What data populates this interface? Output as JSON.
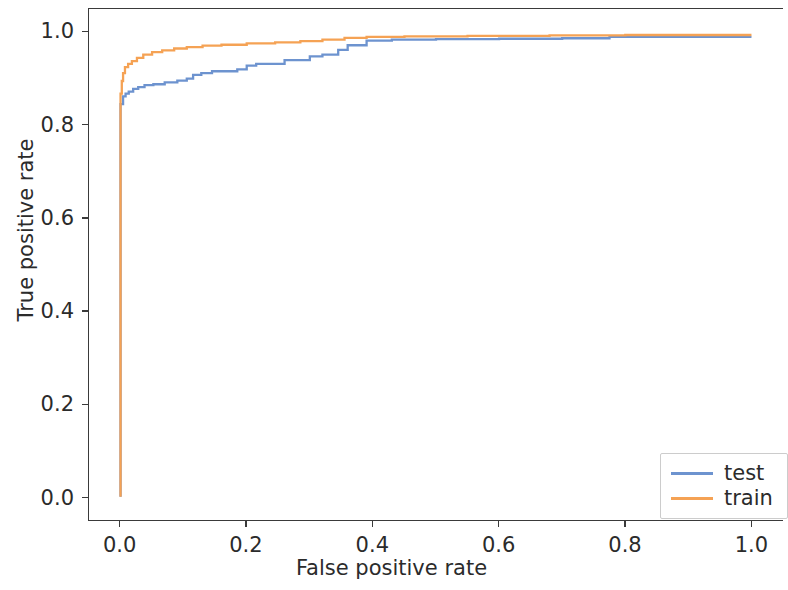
{
  "chart_data": {
    "type": "line",
    "title": "",
    "xlabel": "False positive rate",
    "ylabel": "True positive rate",
    "xlim": [
      -0.05,
      1.05
    ],
    "ylim": [
      -0.05,
      1.05
    ],
    "xticks": [
      0.0,
      0.2,
      0.4,
      0.6,
      0.8,
      1.0
    ],
    "xtick_labels": [
      "0.0",
      "0.2",
      "0.4",
      "0.6",
      "0.8",
      "1.0"
    ],
    "yticks": [
      0.0,
      0.2,
      0.4,
      0.6,
      0.8,
      1.0
    ],
    "ytick_labels": [
      "0.0",
      "0.2",
      "0.4",
      "0.6",
      "0.8",
      "1.0"
    ],
    "grid": false,
    "legend_position": "lower right",
    "series": [
      {
        "name": "test",
        "color": "#6d93cf",
        "points": [
          [
            0.0,
            0.0
          ],
          [
            0.0,
            0.845
          ],
          [
            0.004,
            0.845
          ],
          [
            0.004,
            0.862
          ],
          [
            0.008,
            0.862
          ],
          [
            0.008,
            0.868
          ],
          [
            0.013,
            0.868
          ],
          [
            0.013,
            0.872
          ],
          [
            0.02,
            0.872
          ],
          [
            0.02,
            0.878
          ],
          [
            0.028,
            0.878
          ],
          [
            0.028,
            0.882
          ],
          [
            0.038,
            0.882
          ],
          [
            0.038,
            0.886
          ],
          [
            0.052,
            0.886
          ],
          [
            0.052,
            0.888
          ],
          [
            0.07,
            0.888
          ],
          [
            0.07,
            0.892
          ],
          [
            0.09,
            0.892
          ],
          [
            0.09,
            0.896
          ],
          [
            0.105,
            0.896
          ],
          [
            0.105,
            0.9
          ],
          [
            0.115,
            0.9
          ],
          [
            0.115,
            0.908
          ],
          [
            0.128,
            0.908
          ],
          [
            0.128,
            0.912
          ],
          [
            0.145,
            0.912
          ],
          [
            0.145,
            0.916
          ],
          [
            0.185,
            0.916
          ],
          [
            0.185,
            0.92
          ],
          [
            0.2,
            0.92
          ],
          [
            0.2,
            0.928
          ],
          [
            0.215,
            0.928
          ],
          [
            0.215,
            0.932
          ],
          [
            0.26,
            0.932
          ],
          [
            0.26,
            0.94
          ],
          [
            0.3,
            0.94
          ],
          [
            0.3,
            0.948
          ],
          [
            0.32,
            0.948
          ],
          [
            0.32,
            0.952
          ],
          [
            0.345,
            0.952
          ],
          [
            0.345,
            0.962
          ],
          [
            0.36,
            0.962
          ],
          [
            0.36,
            0.972
          ],
          [
            0.39,
            0.972
          ],
          [
            0.39,
            0.982
          ],
          [
            0.43,
            0.982
          ],
          [
            0.43,
            0.984
          ],
          [
            0.5,
            0.984
          ],
          [
            0.5,
            0.985
          ],
          [
            0.6,
            0.985
          ],
          [
            0.6,
            0.986
          ],
          [
            0.7,
            0.986
          ],
          [
            0.7,
            0.987
          ],
          [
            0.775,
            0.987
          ],
          [
            0.775,
            0.99
          ],
          [
            1.0,
            0.99
          ]
        ]
      },
      {
        "name": "train",
        "color": "#f5a254",
        "points": [
          [
            0.0,
            0.0
          ],
          [
            0.0,
            0.868
          ],
          [
            0.002,
            0.868
          ],
          [
            0.002,
            0.895
          ],
          [
            0.004,
            0.895
          ],
          [
            0.004,
            0.912
          ],
          [
            0.007,
            0.912
          ],
          [
            0.007,
            0.925
          ],
          [
            0.012,
            0.925
          ],
          [
            0.012,
            0.932
          ],
          [
            0.018,
            0.932
          ],
          [
            0.018,
            0.938
          ],
          [
            0.026,
            0.938
          ],
          [
            0.026,
            0.945
          ],
          [
            0.036,
            0.945
          ],
          [
            0.036,
            0.952
          ],
          [
            0.05,
            0.952
          ],
          [
            0.05,
            0.957
          ],
          [
            0.066,
            0.957
          ],
          [
            0.066,
            0.961
          ],
          [
            0.085,
            0.961
          ],
          [
            0.085,
            0.965
          ],
          [
            0.105,
            0.965
          ],
          [
            0.105,
            0.968
          ],
          [
            0.13,
            0.968
          ],
          [
            0.13,
            0.971
          ],
          [
            0.16,
            0.971
          ],
          [
            0.16,
            0.973
          ],
          [
            0.2,
            0.973
          ],
          [
            0.2,
            0.976
          ],
          [
            0.245,
            0.976
          ],
          [
            0.245,
            0.978
          ],
          [
            0.285,
            0.978
          ],
          [
            0.285,
            0.981
          ],
          [
            0.32,
            0.981
          ],
          [
            0.32,
            0.984
          ],
          [
            0.355,
            0.984
          ],
          [
            0.355,
            0.988
          ],
          [
            0.39,
            0.988
          ],
          [
            0.39,
            0.99
          ],
          [
            0.45,
            0.99
          ],
          [
            0.45,
            0.991
          ],
          [
            0.55,
            0.991
          ],
          [
            0.55,
            0.992
          ],
          [
            0.68,
            0.992
          ],
          [
            0.68,
            0.993
          ],
          [
            0.8,
            0.993
          ],
          [
            0.8,
            0.994
          ],
          [
            1.0,
            0.994
          ]
        ]
      }
    ],
    "legend": [
      {
        "label": "test",
        "color": "#6d93cf"
      },
      {
        "label": "train",
        "color": "#f5a254"
      }
    ]
  }
}
